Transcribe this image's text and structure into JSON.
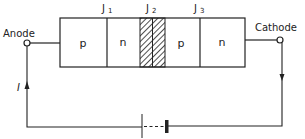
{
  "diagram": {
    "terminals": {
      "anode": "Anode",
      "cathode": "Cathode"
    },
    "layers": [
      "p",
      "n",
      "p",
      "n"
    ],
    "junctions": [
      "J1",
      "J2",
      "J3"
    ],
    "junction_labels": {
      "j1_main": "J",
      "j1_sub": "1",
      "j2_main": "J",
      "j2_sub": "2",
      "j3_main": "J",
      "j3_sub": "3"
    },
    "current_label": "I",
    "highlighted_junction": "J2",
    "colors": {
      "line": "#222222",
      "background": "#ffffff"
    }
  }
}
